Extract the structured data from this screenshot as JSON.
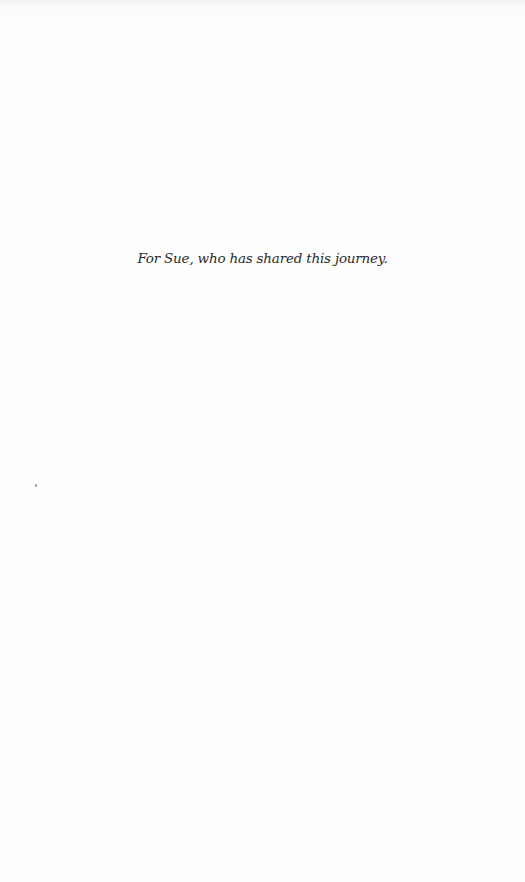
{
  "page": {
    "dedication": "For Sue, who has shared this journey."
  }
}
